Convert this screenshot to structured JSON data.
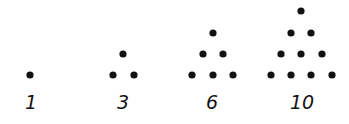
{
  "colors": {
    "dot": "#111111",
    "background": "#ffffff"
  },
  "figures": [
    {
      "label": "1",
      "rows": 1,
      "label_x": 31,
      "dots": [
        [
          30,
          75
        ]
      ]
    },
    {
      "label": "3",
      "rows": 2,
      "label_x": 123,
      "dots": [
        [
          123,
          54
        ],
        [
          113,
          75
        ],
        [
          134,
          75
        ]
      ]
    },
    {
      "label": "6",
      "rows": 3,
      "label_x": 212,
      "dots": [
        [
          213,
          33
        ],
        [
          203,
          54
        ],
        [
          223,
          54
        ],
        [
          192,
          75
        ],
        [
          213,
          75
        ],
        [
          233,
          75
        ]
      ]
    },
    {
      "label": "10",
      "rows": 4,
      "label_x": 302,
      "dots": [
        [
          301,
          11
        ],
        [
          291,
          33
        ],
        [
          311,
          33
        ],
        [
          281,
          54
        ],
        [
          301,
          54
        ],
        [
          322,
          54
        ],
        [
          271,
          75
        ],
        [
          291,
          75
        ],
        [
          311,
          75
        ],
        [
          332,
          75
        ]
      ]
    }
  ],
  "label_y": 109,
  "dot_radius": 3.6
}
